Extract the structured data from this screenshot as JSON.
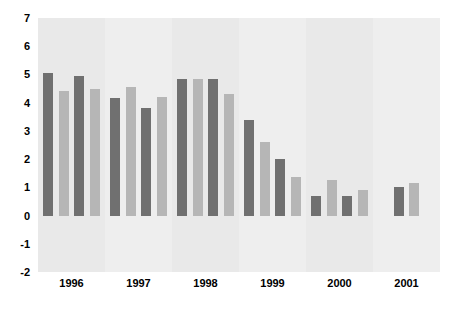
{
  "chart_data": {
    "type": "bar",
    "title": "",
    "subtitle": "",
    "xlabel": "",
    "ylabel": "",
    "categories": [
      "1996",
      "1997",
      "1998",
      "1999",
      "2000",
      "2001"
    ],
    "ylim": [
      -2,
      7
    ],
    "yticks": [
      7,
      6,
      5,
      4,
      3,
      2,
      1,
      0,
      -1,
      -2
    ],
    "ytick_labels": [
      "7",
      "6",
      "5",
      "4",
      "3",
      "2",
      "1",
      "0",
      "-1",
      "-2"
    ],
    "grid": false,
    "legend": "none",
    "series": [
      {
        "name": "series-1",
        "color": "#707070",
        "values": [
          5.05,
          4.15,
          4.85,
          3.4,
          0.7,
          1.0
        ]
      },
      {
        "name": "series-2",
        "color": "#b6b6b6",
        "values": [
          4.4,
          4.55,
          4.85,
          2.6,
          1.25,
          1.15
        ]
      },
      {
        "name": "series-3",
        "color": "#707070",
        "values": [
          4.95,
          3.8,
          4.85,
          2.0,
          0.7,
          null
        ]
      },
      {
        "name": "series-4",
        "color": "#b6b6b6",
        "values": [
          4.5,
          4.2,
          4.3,
          1.35,
          0.9,
          null
        ]
      }
    ],
    "bands": [
      "#e9e9e9",
      "#eeeeee",
      "#e9e9e9",
      "#eeeeee",
      "#e9e9e9",
      "#eeeeee"
    ],
    "plot_background": "#ebebeb",
    "figure_background": "#ffffff"
  }
}
